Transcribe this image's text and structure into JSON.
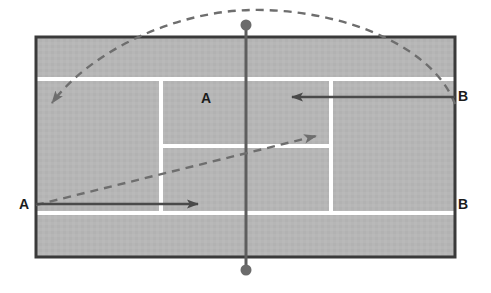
{
  "diagram": {
    "type": "tennis-court-tactics",
    "labels": [
      {
        "id": "a-left",
        "text": "A",
        "x": 22,
        "y": 204,
        "role": "player-a-baseline-left"
      },
      {
        "id": "a-court",
        "text": "A",
        "x": 207,
        "y": 99,
        "role": "player-a-target-service-box"
      },
      {
        "id": "b-right-top",
        "text": "B",
        "x": 461,
        "y": 97,
        "role": "player-b-upper-right"
      },
      {
        "id": "b-right-bot",
        "text": "B",
        "x": 461,
        "y": 204,
        "role": "player-b-lower-right"
      }
    ],
    "court": {
      "outer": {
        "x": 36,
        "y": 37,
        "width": 419,
        "height": 220
      },
      "surface_color": "#b6b6b6",
      "boundary_color": "#3a3a3a",
      "line_color": "#ffffff",
      "line_width": 4,
      "boundary_width": 3,
      "singles_line_top_y": 79,
      "singles_line_bottom_y": 213,
      "service_box_left_x": 161,
      "service_box_right_x": 331,
      "service_line_y": 146,
      "net_x": 246,
      "net_color": "#5e5e5e",
      "net_post_top": {
        "x": 246,
        "y": 25,
        "r": 5
      },
      "net_post_bottom": {
        "x": 246,
        "y": 270,
        "r": 5
      }
    },
    "solid_arrows": [
      {
        "id": "arrow-a-movement",
        "label": "A",
        "from": {
          "x": 36,
          "y": 204
        },
        "to": {
          "x": 205,
          "y": 204
        },
        "direction": "right",
        "color": "#4a4a4a",
        "style": "solid"
      },
      {
        "id": "arrow-b-movement",
        "label": "B",
        "from": {
          "x": 455,
          "y": 97
        },
        "to": {
          "x": 284,
          "y": 97
        },
        "direction": "left",
        "color": "#4a4a4a",
        "style": "solid"
      }
    ],
    "dashed_paths": [
      {
        "id": "lob-path",
        "description": "High lob arc from right baseline over the net to the far left backcourt",
        "from": {
          "x": 455,
          "y": 104
        },
        "apex": {
          "x": 250,
          "y": 10
        },
        "to": {
          "x": 48,
          "y": 108
        },
        "color": "#6e6e6e",
        "style": "dashed",
        "arrowhead": "down-left"
      },
      {
        "id": "drive-path",
        "description": "Low cross-court drive from left baseline to the right service box corner",
        "from": {
          "x": 36,
          "y": 205
        },
        "to": {
          "x": 322,
          "y": 134
        },
        "color": "#6e6e6e",
        "style": "dashed",
        "arrowhead": "up-right"
      }
    ]
  }
}
